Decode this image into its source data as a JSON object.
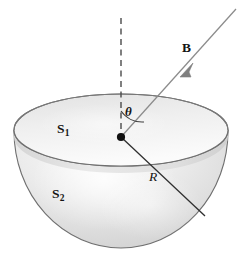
{
  "figure": {
    "type": "physics-diagram",
    "canvas": {
      "width": 242,
      "height": 256,
      "background": "#ffffff"
    },
    "labels": {
      "surface_top": {
        "base": "S",
        "sub": "1",
        "role": "flat circular cap surface"
      },
      "surface_bowl": {
        "base": "S",
        "sub": "2",
        "role": "curved hemispherical surface"
      },
      "field_vector": {
        "text": "B",
        "role": "magnetic field vector (bold)"
      },
      "radius": {
        "text": "R",
        "role": "hemisphere radius (italic)"
      },
      "angle": {
        "text": "θ",
        "role": "angle between field and normal axis"
      }
    },
    "geometry": {
      "center": {
        "x": 121,
        "y": 137
      },
      "rim_ellipse": {
        "cx": 121,
        "cy": 130,
        "rx": 107,
        "ry": 36
      },
      "bowl_bottom_y": 247,
      "axis_dashed": {
        "x": 121,
        "y_top": 18,
        "y_bottom": 137
      },
      "field_line": {
        "x1": 236,
        "y1": 9,
        "x2": 121,
        "y2": 137
      },
      "radius_line": {
        "x1": 121,
        "y1": 137,
        "x2": 205,
        "y2": 216
      },
      "arrowhead": {
        "x": 185,
        "y": 72
      },
      "angle_arc_radius": 26
    },
    "colors": {
      "stroke": "#6b6b6b",
      "stroke_dark": "#3a3a3a",
      "text": "#141414",
      "fill_light": "#f2f2f2",
      "fill_mid": "#d9d9d9",
      "fill_shade": "#c9c9c9",
      "background": "#ffffff"
    }
  }
}
